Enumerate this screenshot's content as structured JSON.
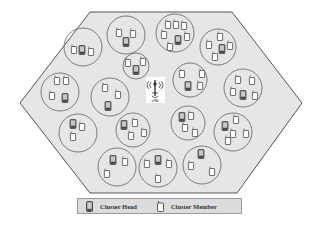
{
  "diagram": {
    "type": "cellular-cluster-network",
    "cell_shape": "hexagon",
    "cell_fill": "#e6e6e6",
    "cell_stroke": "#555555",
    "circle_stroke": "#6e6e6e",
    "base_station": {
      "label": "eNB",
      "x": 155,
      "y": 90
    },
    "clusters": [
      {
        "cx": 83,
        "cy": 47,
        "r": 19,
        "heads": [
          [
            82,
            50
          ]
        ],
        "members": [
          [
            74,
            50
          ],
          [
            91,
            52
          ]
        ]
      },
      {
        "cx": 126,
        "cy": 35,
        "r": 19,
        "heads": [
          [
            126,
            42
          ]
        ],
        "members": [
          [
            119,
            33
          ],
          [
            133,
            34
          ]
        ]
      },
      {
        "cx": 136,
        "cy": 66,
        "r": 13,
        "heads": [
          [
            136,
            70
          ]
        ],
        "members": [
          [
            128,
            63
          ],
          [
            143,
            62
          ]
        ]
      },
      {
        "cx": 175,
        "cy": 33,
        "r": 19,
        "heads": [
          [
            178,
            40
          ]
        ],
        "members": [
          [
            168,
            25
          ],
          [
            176,
            25
          ],
          [
            184,
            26
          ],
          [
            164,
            35
          ],
          [
            187,
            37
          ],
          [
            170,
            47
          ]
        ]
      },
      {
        "cx": 218,
        "cy": 47,
        "r": 18,
        "heads": [
          [
            222,
            49
          ]
        ],
        "members": [
          [
            220,
            37
          ],
          [
            209,
            45
          ],
          [
            230,
            46
          ],
          [
            215,
            57
          ]
        ]
      },
      {
        "cx": 60,
        "cy": 92,
        "r": 19,
        "heads": [
          [
            65,
            98
          ]
        ],
        "members": [
          [
            57,
            81
          ],
          [
            66,
            81
          ],
          [
            52,
            96
          ]
        ]
      },
      {
        "cx": 110,
        "cy": 97,
        "r": 19,
        "heads": [
          [
            108,
            106
          ]
        ],
        "members": [
          [
            105,
            88
          ],
          [
            118,
            95
          ]
        ]
      },
      {
        "cx": 190,
        "cy": 80,
        "r": 17,
        "heads": [
          [
            188,
            86
          ]
        ],
        "members": [
          [
            182,
            74
          ],
          [
            202,
            74
          ],
          [
            200,
            86
          ]
        ]
      },
      {
        "cx": 243,
        "cy": 88,
        "r": 19,
        "heads": [
          [
            243,
            95
          ]
        ],
        "members": [
          [
            238,
            80
          ],
          [
            252,
            81
          ],
          [
            233,
            92
          ],
          [
            255,
            96
          ]
        ]
      },
      {
        "cx": 78,
        "cy": 133,
        "r": 19,
        "heads": [
          [
            73,
            124
          ]
        ],
        "members": [
          [
            82,
            127
          ],
          [
            73,
            137
          ]
        ]
      },
      {
        "cx": 133,
        "cy": 130,
        "r": 17,
        "heads": [
          [
            124,
            125
          ]
        ],
        "members": [
          [
            135,
            123
          ],
          [
            131,
            136
          ],
          [
            144,
            133
          ]
        ]
      },
      {
        "cx": 188,
        "cy": 123,
        "r": 17,
        "heads": [
          [
            182,
            117
          ]
        ],
        "members": [
          [
            191,
            116
          ],
          [
            185,
            128
          ],
          [
            195,
            133
          ]
        ]
      },
      {
        "cx": 233,
        "cy": 132,
        "r": 19,
        "heads": [
          [
            225,
            126
          ]
        ],
        "members": [
          [
            236,
            120
          ],
          [
            233,
            134
          ],
          [
            246,
            134
          ],
          [
            228,
            141
          ]
        ]
      },
      {
        "cx": 117,
        "cy": 167,
        "r": 19,
        "heads": [
          [
            113,
            160
          ]
        ],
        "members": [
          [
            125,
            162
          ],
          [
            107,
            174
          ]
        ]
      },
      {
        "cx": 158,
        "cy": 168,
        "r": 19,
        "heads": [
          [
            158,
            160
          ]
        ],
        "members": [
          [
            147,
            164
          ],
          [
            169,
            164
          ],
          [
            158,
            179
          ]
        ]
      },
      {
        "cx": 202,
        "cy": 165,
        "r": 19,
        "heads": [
          [
            201,
            154
          ]
        ],
        "members": [
          [
            191,
            166
          ],
          [
            212,
            172
          ]
        ]
      }
    ]
  },
  "legend": {
    "cluster_head_label": "Cluster Head",
    "cluster_member_label": "Cluster Member"
  }
}
